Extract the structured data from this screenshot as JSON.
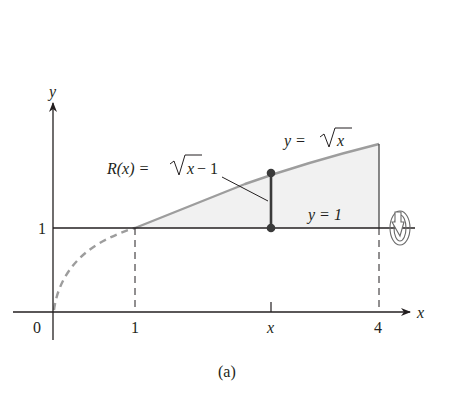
{
  "figure": {
    "caption": "(a)",
    "colors": {
      "axis": "#231f20",
      "curve": "#9d9d9d",
      "region_fill": "#f1f1f1",
      "segment": "#3a3a3a"
    }
  },
  "axes": {
    "x_label": "x",
    "y_label": "y",
    "x_ticks": [
      {
        "value": 0,
        "label": "0"
      },
      {
        "value": 1,
        "label": "1"
      },
      {
        "value": "x",
        "label": "x"
      },
      {
        "value": 4,
        "label": "4"
      }
    ],
    "y_ticks": [
      {
        "value": 1,
        "label": "1"
      }
    ]
  },
  "curves": {
    "sqrt_label_lhs": "y = ",
    "sqrt_label_radicand": "x",
    "line_label": "y = 1"
  },
  "annotation": {
    "radius_lhs": "R(x) = ",
    "radius_radicand": "x",
    "radius_rhs": " − 1"
  },
  "revolution_icon": "rotation-about-axis-icon"
}
